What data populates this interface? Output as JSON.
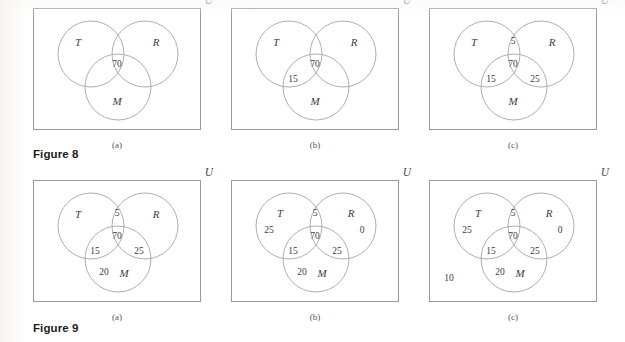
{
  "page": {
    "background_color": "#ffffff",
    "ink_color": "#3a3a3a",
    "outline_color": "#9a9a9a",
    "circle_stroke_color": "#a5a5a5"
  },
  "figures": [
    {
      "id": "figure-8",
      "caption": "Figure 8",
      "panels": [
        {
          "caption": "(a)",
          "universe_label": "U",
          "set_labels": [
            {
              "name": "T",
              "text": "T",
              "x": 44,
              "y": 33
            },
            {
              "name": "R",
              "text": "R",
              "x": 122,
              "y": 33
            },
            {
              "name": "M",
              "text": "M",
              "x": 83,
              "y": 92
            }
          ],
          "region_values": [
            {
              "name": "t-r-m-intersection",
              "text": "70",
              "x": 83,
              "y": 56
            }
          ]
        },
        {
          "caption": "(b)",
          "universe_label": "U",
          "set_labels": [
            {
              "name": "T",
              "text": "T",
              "x": 44,
              "y": 33
            },
            {
              "name": "R",
              "text": "R",
              "x": 122,
              "y": 33
            },
            {
              "name": "M",
              "text": "M",
              "x": 83,
              "y": 92
            }
          ],
          "region_values": [
            {
              "name": "t-r-m-intersection",
              "text": "70",
              "x": 83,
              "y": 56
            },
            {
              "name": "t-and-m-only",
              "text": "15",
              "x": 61,
              "y": 71
            }
          ]
        },
        {
          "caption": "(c)",
          "universe_label": "U",
          "set_labels": [
            {
              "name": "T",
              "text": "T",
              "x": 44,
              "y": 33
            },
            {
              "name": "R",
              "text": "R",
              "x": 122,
              "y": 33
            },
            {
              "name": "M",
              "text": "M",
              "x": 83,
              "y": 92
            }
          ],
          "region_values": [
            {
              "name": "t-and-r-only",
              "text": "5",
              "x": 83,
              "y": 33
            },
            {
              "name": "t-r-m-intersection",
              "text": "70",
              "x": 83,
              "y": 56
            },
            {
              "name": "t-and-m-only",
              "text": "15",
              "x": 61,
              "y": 71
            },
            {
              "name": "r-and-m-only",
              "text": "25",
              "x": 105,
              "y": 71
            }
          ]
        }
      ]
    },
    {
      "id": "figure-9",
      "caption": "Figure 9",
      "panels": [
        {
          "caption": "(a)",
          "universe_label": "U",
          "set_labels": [
            {
              "name": "T",
              "text": "T",
              "x": 44,
              "y": 33
            },
            {
              "name": "R",
              "text": "R",
              "x": 122,
              "y": 33
            },
            {
              "name": "M",
              "text": "M",
              "x": 90,
              "y": 92
            }
          ],
          "region_values": [
            {
              "name": "t-and-r-only",
              "text": "5",
              "x": 83,
              "y": 33
            },
            {
              "name": "t-r-m-intersection",
              "text": "70",
              "x": 83,
              "y": 56
            },
            {
              "name": "t-and-m-only",
              "text": "15",
              "x": 61,
              "y": 71
            },
            {
              "name": "r-and-m-only",
              "text": "25",
              "x": 105,
              "y": 71
            },
            {
              "name": "m-only",
              "text": "20",
              "x": 70,
              "y": 92
            }
          ]
        },
        {
          "caption": "(b)",
          "universe_label": "U",
          "set_labels": [
            {
              "name": "T",
              "text": "T",
              "x": 48,
              "y": 32
            },
            {
              "name": "R",
              "text": "R",
              "x": 119,
              "y": 32
            },
            {
              "name": "M",
              "text": "M",
              "x": 90,
              "y": 92
            }
          ],
          "region_values": [
            {
              "name": "t-and-r-only",
              "text": "5",
              "x": 83,
              "y": 33
            },
            {
              "name": "t-r-m-intersection",
              "text": "70",
              "x": 83,
              "y": 56
            },
            {
              "name": "t-and-m-only",
              "text": "15",
              "x": 61,
              "y": 71
            },
            {
              "name": "r-and-m-only",
              "text": "25",
              "x": 105,
              "y": 71
            },
            {
              "name": "m-only",
              "text": "20",
              "x": 70,
              "y": 92
            },
            {
              "name": "t-only",
              "text": "25",
              "x": 37,
              "y": 50
            },
            {
              "name": "r-only",
              "text": "0",
              "x": 130,
              "y": 50
            }
          ]
        },
        {
          "caption": "(c)",
          "universe_label": "U",
          "set_labels": [
            {
              "name": "T",
              "text": "T",
              "x": 48,
              "y": 32
            },
            {
              "name": "R",
              "text": "R",
              "x": 119,
              "y": 32
            },
            {
              "name": "M",
              "text": "M",
              "x": 90,
              "y": 92
            }
          ],
          "region_values": [
            {
              "name": "t-and-r-only",
              "text": "5",
              "x": 83,
              "y": 33
            },
            {
              "name": "t-r-m-intersection",
              "text": "70",
              "x": 83,
              "y": 56
            },
            {
              "name": "t-and-m-only",
              "text": "15",
              "x": 61,
              "y": 71
            },
            {
              "name": "r-and-m-only",
              "text": "25",
              "x": 105,
              "y": 71
            },
            {
              "name": "m-only",
              "text": "20",
              "x": 70,
              "y": 92
            },
            {
              "name": "t-only",
              "text": "25",
              "x": 37,
              "y": 50
            },
            {
              "name": "r-only",
              "text": "0",
              "x": 130,
              "y": 50
            },
            {
              "name": "outside-all-sets",
              "text": "10",
              "x": 19,
              "y": 98
            }
          ]
        }
      ]
    }
  ],
  "venn_geometry": {
    "radius": 33,
    "circles": [
      {
        "name": "T",
        "cx": 57,
        "cy": 45
      },
      {
        "name": "R",
        "cx": 111,
        "cy": 45
      },
      {
        "name": "M",
        "cx": 84,
        "cy": 78
      }
    ]
  }
}
